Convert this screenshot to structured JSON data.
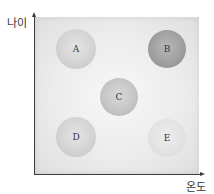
{
  "diagram": {
    "y_axis_label": "나이",
    "x_axis_label": "온도",
    "circles": [
      {
        "label": "A",
        "cx": 76,
        "cy": 49,
        "r": 20,
        "shade": "light"
      },
      {
        "label": "B",
        "cx": 167,
        "cy": 49,
        "r": 19,
        "shade": "dark"
      },
      {
        "label": "C",
        "cx": 119,
        "cy": 97,
        "r": 19,
        "shade": "mid"
      },
      {
        "label": "D",
        "cx": 76,
        "cy": 137,
        "r": 20,
        "shade": "light"
      },
      {
        "label": "E",
        "cx": 167,
        "cy": 138,
        "r": 19,
        "shade": "faint"
      }
    ]
  }
}
